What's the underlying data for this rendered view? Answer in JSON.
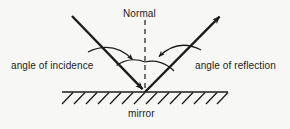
{
  "diagram": {
    "type": "physics-ray-diagram",
    "background_color": "#f7f7f5",
    "stroke_color": "#1c1c1c",
    "labels": {
      "normal": "Normal",
      "angle_of_incidence": "angle of incidence",
      "angle_of_reflection": "angle of reflection",
      "mirror": "mirror"
    },
    "geometry": {
      "vertex": [
        145,
        92
      ],
      "incident_ray": {
        "from": [
          72,
          16
        ],
        "to": [
          145,
          92
        ],
        "arrow_at": "to"
      },
      "reflected_ray": {
        "from": [
          145,
          92
        ],
        "to": [
          222,
          14
        ],
        "arrow_at": "to"
      },
      "normal_line": {
        "from": [
          145,
          20
        ],
        "to": [
          145,
          92
        ],
        "style": "dashed"
      },
      "mirror_line": {
        "from": [
          62,
          92
        ],
        "to": [
          228,
          92
        ]
      },
      "hatching": {
        "count": 14,
        "slant": "up-right",
        "below_line": true
      },
      "arc_incidence": {
        "radius": 30,
        "between": [
          "incident_ray",
          "normal_line"
        ]
      },
      "arc_reflection": {
        "radius": 30,
        "between": [
          "normal_line",
          "reflected_ray"
        ]
      },
      "pointer_incidence": {
        "from": [
          88,
          52
        ],
        "to": [
          134,
          61
        ],
        "arrow_at": "to"
      },
      "pointer_reflection": {
        "from": [
          201,
          50
        ],
        "to": [
          157,
          58
        ],
        "arrow_at": "to"
      }
    }
  }
}
